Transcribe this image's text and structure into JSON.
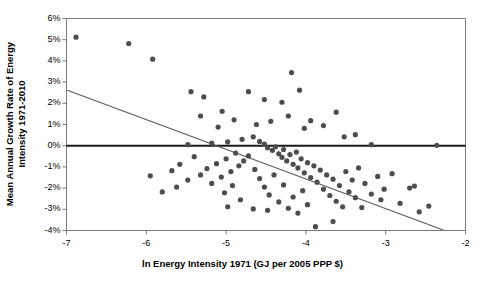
{
  "chart_data": {
    "type": "scatter",
    "title": "",
    "xlabel": "ln Energy Intensity 1971 (GJ per 2005 PPP $)",
    "ylabel_line1": "Mean Annual Growth Rate of Energy",
    "ylabel_line2": "Intensity 1971-2010",
    "xlim": [
      -7,
      -2
    ],
    "ylim": [
      -4,
      6
    ],
    "xticks": [
      -7,
      -6,
      -5,
      -4,
      -3,
      -2
    ],
    "xtick_labels": [
      "-7",
      "-6",
      "-5",
      "-4",
      "-3",
      "-2"
    ],
    "yticks": [
      6,
      5,
      4,
      3,
      2,
      1,
      0,
      -1,
      -2,
      -3,
      -4
    ],
    "ytick_labels": [
      "6%",
      "5%",
      "4%",
      "3%",
      "2%",
      "1%",
      "0%",
      "-1%",
      "-2%",
      "-3%",
      "-4%"
    ],
    "grid": false,
    "legend": null,
    "y_unit": "percent",
    "marker_color": "#4d4d4d",
    "marker_size": 2.6,
    "axis_color": "#7a7a7a",
    "zero_line": {
      "value": 0,
      "color": "#1a1a1a",
      "width": 1.9
    },
    "trendline": {
      "label": "linear fit",
      "color": "#5a5a5a",
      "width": 1.1,
      "x_start": -6.99,
      "y_start": 2.62,
      "x_end": -2.28,
      "y_end": -3.98
    },
    "points": [
      {
        "x": -6.88,
        "y": 5.12
      },
      {
        "x": -6.22,
        "y": 4.82
      },
      {
        "x": -5.92,
        "y": 4.08
      },
      {
        "x": -5.44,
        "y": 2.55
      },
      {
        "x": -5.28,
        "y": 2.3
      },
      {
        "x": -5.05,
        "y": 1.62
      },
      {
        "x": -4.72,
        "y": 2.55
      },
      {
        "x": -4.52,
        "y": 2.18
      },
      {
        "x": -4.3,
        "y": 2.05
      },
      {
        "x": -4.18,
        "y": 3.45
      },
      {
        "x": -4.08,
        "y": 2.62
      },
      {
        "x": -3.62,
        "y": 1.58
      },
      {
        "x": -3.94,
        "y": 1.18
      },
      {
        "x": -4.44,
        "y": 1.15
      },
      {
        "x": -4.62,
        "y": 1.0
      },
      {
        "x": -4.9,
        "y": 1.22
      },
      {
        "x": -5.1,
        "y": 0.88
      },
      {
        "x": -5.32,
        "y": 1.4
      },
      {
        "x": -4.22,
        "y": 1.4
      },
      {
        "x": -4.02,
        "y": 0.82
      },
      {
        "x": -3.78,
        "y": 0.95
      },
      {
        "x": -3.52,
        "y": 0.42
      },
      {
        "x": -3.38,
        "y": 0.52
      },
      {
        "x": -3.18,
        "y": 0.05
      },
      {
        "x": -2.36,
        "y": 0.02
      },
      {
        "x": -4.8,
        "y": 0.3
      },
      {
        "x": -4.98,
        "y": 0.18
      },
      {
        "x": -5.18,
        "y": 0.12
      },
      {
        "x": -5.48,
        "y": 0.05
      },
      {
        "x": -4.66,
        "y": 0.42
      },
      {
        "x": -4.58,
        "y": 0.2
      },
      {
        "x": -4.52,
        "y": 0.08
      },
      {
        "x": -4.48,
        "y": -0.1
      },
      {
        "x": -4.42,
        "y": -0.22
      },
      {
        "x": -4.38,
        "y": -0.05
      },
      {
        "x": -4.34,
        "y": -0.38
      },
      {
        "x": -4.3,
        "y": -0.55
      },
      {
        "x": -4.28,
        "y": -0.18
      },
      {
        "x": -4.24,
        "y": -0.72
      },
      {
        "x": -4.2,
        "y": -0.42
      },
      {
        "x": -4.16,
        "y": -0.88
      },
      {
        "x": -4.12,
        "y": -0.3
      },
      {
        "x": -4.1,
        "y": -1.05
      },
      {
        "x": -4.06,
        "y": -0.62
      },
      {
        "x": -4.02,
        "y": -1.28
      },
      {
        "x": -3.98,
        "y": -0.8
      },
      {
        "x": -3.94,
        "y": -1.5
      },
      {
        "x": -3.9,
        "y": -0.95
      },
      {
        "x": -3.86,
        "y": -1.72
      },
      {
        "x": -3.82,
        "y": -1.15
      },
      {
        "x": -3.78,
        "y": -2.05
      },
      {
        "x": -3.74,
        "y": -1.38
      },
      {
        "x": -3.7,
        "y": -2.35
      },
      {
        "x": -3.66,
        "y": -1.58
      },
      {
        "x": -3.62,
        "y": -2.62
      },
      {
        "x": -3.58,
        "y": -1.88
      },
      {
        "x": -3.54,
        "y": -2.88
      },
      {
        "x": -3.5,
        "y": -1.22
      },
      {
        "x": -3.46,
        "y": -2.18
      },
      {
        "x": -3.42,
        "y": -1.62
      },
      {
        "x": -3.38,
        "y": -2.45
      },
      {
        "x": -3.34,
        "y": -1.05
      },
      {
        "x": -3.26,
        "y": -1.78
      },
      {
        "x": -3.18,
        "y": -2.28
      },
      {
        "x": -3.1,
        "y": -1.45
      },
      {
        "x": -3.02,
        "y": -2.05
      },
      {
        "x": -2.92,
        "y": -1.32
      },
      {
        "x": -2.82,
        "y": -2.72
      },
      {
        "x": -2.7,
        "y": -2.0
      },
      {
        "x": -2.58,
        "y": -3.12
      },
      {
        "x": -2.46,
        "y": -2.85
      },
      {
        "x": -4.72,
        "y": -0.48
      },
      {
        "x": -4.78,
        "y": -0.72
      },
      {
        "x": -4.84,
        "y": -0.95
      },
      {
        "x": -4.88,
        "y": -0.35
      },
      {
        "x": -4.94,
        "y": -1.22
      },
      {
        "x": -5.0,
        "y": -0.62
      },
      {
        "x": -5.06,
        "y": -1.48
      },
      {
        "x": -5.12,
        "y": -0.85
      },
      {
        "x": -5.18,
        "y": -1.78
      },
      {
        "x": -5.24,
        "y": -1.08
      },
      {
        "x": -5.32,
        "y": -1.38
      },
      {
        "x": -5.4,
        "y": -0.52
      },
      {
        "x": -5.48,
        "y": -1.62
      },
      {
        "x": -5.58,
        "y": -0.88
      },
      {
        "x": -5.68,
        "y": -1.18
      },
      {
        "x": -5.8,
        "y": -2.18
      },
      {
        "x": -5.95,
        "y": -1.42
      },
      {
        "x": -4.64,
        "y": -1.12
      },
      {
        "x": -4.58,
        "y": -1.55
      },
      {
        "x": -4.52,
        "y": -1.95
      },
      {
        "x": -4.46,
        "y": -2.32
      },
      {
        "x": -4.4,
        "y": -1.38
      },
      {
        "x": -4.34,
        "y": -2.65
      },
      {
        "x": -4.28,
        "y": -1.85
      },
      {
        "x": -4.22,
        "y": -2.95
      },
      {
        "x": -4.16,
        "y": -2.42
      },
      {
        "x": -4.1,
        "y": -3.18
      },
      {
        "x": -4.04,
        "y": -2.12
      },
      {
        "x": -3.98,
        "y": -2.78
      },
      {
        "x": -3.88,
        "y": -3.82
      },
      {
        "x": -3.66,
        "y": -3.58
      },
      {
        "x": -4.48,
        "y": -3.05
      },
      {
        "x": -4.82,
        "y": -2.55
      },
      {
        "x": -5.02,
        "y": -2.22
      },
      {
        "x": -4.98,
        "y": -2.88
      },
      {
        "x": -4.66,
        "y": -2.98
      },
      {
        "x": -4.92,
        "y": -1.88
      },
      {
        "x": -3.3,
        "y": -2.92
      },
      {
        "x": -3.06,
        "y": -2.55
      },
      {
        "x": -2.64,
        "y": -1.9
      },
      {
        "x": -5.62,
        "y": -1.95
      }
    ]
  }
}
